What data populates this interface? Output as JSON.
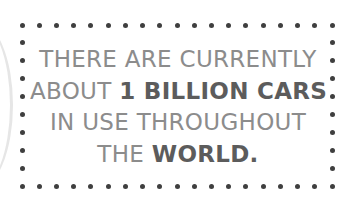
{
  "card": {
    "lines": [
      {
        "parts": [
          {
            "text": "THERE ARE CURRENTLY",
            "bold": false
          }
        ]
      },
      {
        "parts": [
          {
            "text": "ABOUT ",
            "bold": false
          },
          {
            "text": "1 BILLION CARS",
            "bold": true
          }
        ]
      },
      {
        "parts": [
          {
            "text": "IN USE THROUGHOUT",
            "bold": false
          }
        ]
      },
      {
        "parts": [
          {
            "text": "THE ",
            "bold": false
          },
          {
            "text": "WORLD.",
            "bold": true
          }
        ]
      }
    ],
    "full_text": "THERE ARE CURRENTLY ABOUT 1 BILLION CARS IN USE THROUGHOUT THE WORLD.",
    "border": {
      "style": "dotted",
      "dot_color": "#3f3f3f",
      "top_y": 25,
      "bottom_y": 186,
      "left_x": 22,
      "right_x": 332,
      "spacing": 17.2
    },
    "colors": {
      "text": "#8c8c8c",
      "emphasis": "#5c5c5c",
      "background": "#ffffff"
    }
  }
}
